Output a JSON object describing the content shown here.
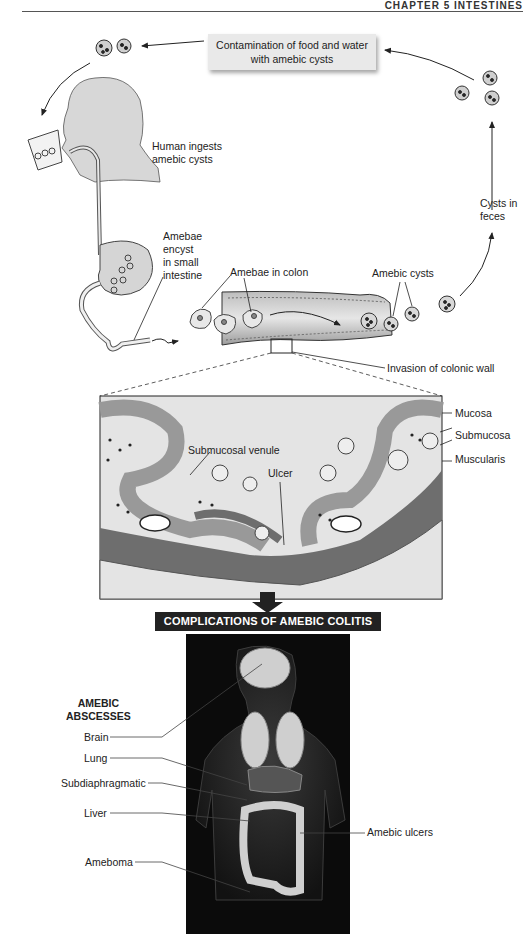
{
  "header": {
    "chapter_label": "CHAPTER 5 INTESTINES"
  },
  "lifecycle": {
    "contamination_box": {
      "line1": "Contamination of food and water",
      "line2": "with amebic cysts"
    },
    "labels": {
      "human_ingests": [
        "Human ingests",
        "amebic cysts"
      ],
      "encyst": [
        "Amebae",
        "encyst",
        "in small",
        "intestine"
      ],
      "amebae_in_colon": "Amebae in colon",
      "amebic_cysts": "Amebic cysts",
      "cysts_in_feces": [
        "Cysts in",
        "feces"
      ],
      "invasion": "Invasion of colonic wall"
    }
  },
  "cross_section": {
    "labels": {
      "mucosa": "Mucosa",
      "submucosa": "Submucosa",
      "muscularis": "Muscularis",
      "submucosal_venule": "Submucosal venule",
      "ulcer": "Ulcer"
    },
    "colors": {
      "mucosa": "#9a9a9a",
      "muscularis": "#6e6e6e",
      "background": "#e4e4e4"
    }
  },
  "complications": {
    "title": "COMPLICATIONS OF AMEBIC COLITIS",
    "abscess_heading": [
      "AMEBIC",
      "ABSCESSES"
    ],
    "abscess_sites": [
      "Brain",
      "Lung",
      "Subdiaphragmatic",
      "Liver",
      "Ameboma"
    ],
    "right_label": "Amebic ulcers"
  }
}
